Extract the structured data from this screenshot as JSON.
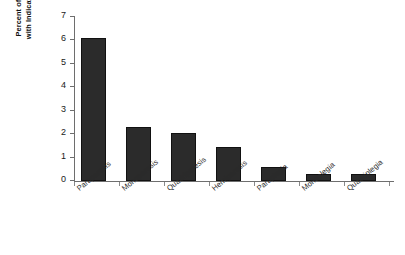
{
  "chart_data": {
    "type": "bar",
    "title": "",
    "xlabel": "",
    "ylabel": "Percent of Total Sample with Indicated Symptoms",
    "ylabel_lines": [
      "Percent of Total Sample",
      "with Indicated Symptoms"
    ],
    "categories": [
      "Paraparesis",
      "Monoparesis",
      "Quadriparesis",
      "Hemiparesis",
      "Paraplegia",
      "Monoplegia",
      "Quadriplegia"
    ],
    "values": [
      6.1,
      2.3,
      2.05,
      1.45,
      0.6,
      0.3,
      0.3
    ],
    "ylim": [
      0,
      7
    ],
    "ytick_labels": [
      "0",
      "1",
      "2",
      "3",
      "4",
      "5",
      "6",
      "7"
    ],
    "ytick_values": [
      0,
      1,
      2,
      3,
      4,
      5,
      6,
      7
    ],
    "grid": false,
    "legend": false,
    "bar_color": "#2b2b2b",
    "axis_color": "#6e6e6e",
    "background_color": "#ffffff"
  }
}
